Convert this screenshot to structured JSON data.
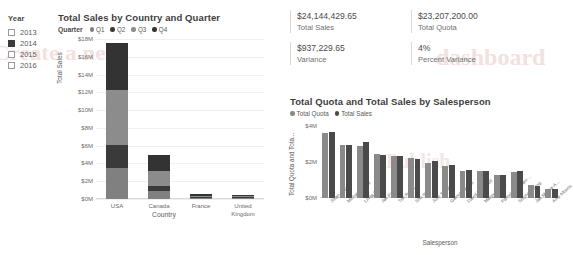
{
  "watermark": {
    "line1": "Create a new",
    "line2": "dashboard",
    "line3": "Publish"
  },
  "slicer": {
    "title": "Year",
    "items": [
      {
        "label": "2013",
        "checked": false
      },
      {
        "label": "2014",
        "checked": true
      },
      {
        "label": "2015",
        "checked": false
      },
      {
        "label": "2016",
        "checked": false
      }
    ]
  },
  "kpis": [
    {
      "value": "$24,144,429.65",
      "label": "Total Sales"
    },
    {
      "value": "$23,207,200.00",
      "label": "Total Quota"
    },
    {
      "value": "$937,229.65",
      "label": "Variance"
    },
    {
      "value": "4%",
      "label": "Percent Variance"
    }
  ],
  "colors": {
    "q1": "#808080",
    "q2": "#3a3a3a",
    "q3": "#8c8c8c",
    "q4": "#333333",
    "quota": "#8a8a8a",
    "sales": "#4a4a4a",
    "grid": "#f0f0f0",
    "axis": "#d8d8d8"
  },
  "chart_data": [
    {
      "type": "bar",
      "stacked": true,
      "title": "Total Sales by Country and Quarter",
      "legend_title": "Quarter",
      "legend_position": "top",
      "grid": true,
      "xlabel": "Country",
      "ylabel": "Total Sales",
      "categories": [
        "USA",
        "Canada",
        "France",
        "United Kingdom"
      ],
      "ylim": [
        0,
        18000000
      ],
      "yticks": [
        "$0M",
        "$2M",
        "$4M",
        "$6M",
        "$8M",
        "$10M",
        "$12M",
        "$14M",
        "$16M",
        "$18M"
      ],
      "ytick_values": [
        0,
        2000000,
        4000000,
        6000000,
        8000000,
        10000000,
        12000000,
        14000000,
        16000000,
        18000000
      ],
      "series": [
        {
          "name": "Q1",
          "color": "#808080",
          "values": [
            3500000,
            900000,
            120000,
            110000
          ]
        },
        {
          "name": "Q2",
          "color": "#3a3a3a",
          "values": [
            2600000,
            600000,
            130000,
            120000
          ]
        },
        {
          "name": "Q3",
          "color": "#8c8c8c",
          "values": [
            6200000,
            1600000,
            140000,
            130000
          ]
        },
        {
          "name": "Q4",
          "color": "#333333",
          "values": [
            5200000,
            1800000,
            160000,
            140000
          ]
        }
      ]
    },
    {
      "type": "bar",
      "stacked": false,
      "title": "Total Quota and Total Sales by Salesperson",
      "legend_position": "top",
      "grid": false,
      "xlabel": "Salesperson",
      "ylabel": "Total Quota and Tota...",
      "ylim": [
        0,
        4000000
      ],
      "yticks": [
        "$0M",
        "$2M",
        "$4M"
      ],
      "ytick_values": [
        0,
        2000000,
        4000000
      ],
      "categories": [
        "Jillian Carson",
        "Michael Blythe",
        "Linda Mitchell",
        "Jae Pak",
        "Tsvi Reiter",
        "Shu Ito",
        "Jose Saraiva",
        "Garrett Vargas",
        "David Campbell",
        "Margy Varkey",
        "Pamela Ansman-...",
        "Stephen Jiang",
        "Jae Mensa-A...",
        "Amy Alberts"
      ],
      "series": [
        {
          "name": "Total Quota",
          "color": "#8a8a8a",
          "values": [
            3620000,
            2920000,
            2880000,
            2420000,
            2320000,
            2220000,
            1960000,
            1760000,
            1520000,
            1500000,
            1260000,
            1460000,
            700000,
            500000
          ]
        },
        {
          "name": "Total Sales",
          "color": "#4a4a4a",
          "values": [
            3680000,
            2960000,
            3120000,
            2400000,
            2340000,
            2180000,
            2060000,
            1840000,
            1540000,
            1520000,
            1280000,
            1500000,
            660000,
            480000
          ]
        }
      ]
    }
  ]
}
